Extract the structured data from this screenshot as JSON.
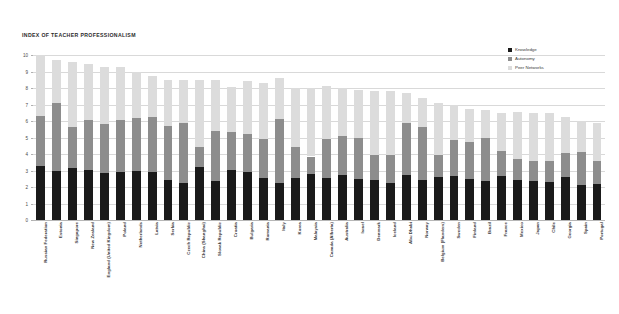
{
  "chart_data": {
    "type": "bar",
    "subtype": "stacked-vertical",
    "title": "INDEX OF TEACHER PROFESSIONALISM",
    "xlabel": "",
    "ylabel": "",
    "ylim": [
      0,
      10
    ],
    "ytick_labels": [
      "0",
      "1",
      "2",
      "3",
      "4",
      "5",
      "6",
      "7",
      "8",
      "9",
      "10"
    ],
    "ytick_values": [
      0,
      1,
      2,
      3,
      4,
      5,
      6,
      7,
      8,
      9,
      10
    ],
    "grid": true,
    "legend_position": "top-right",
    "categories": [
      "Russian Federation",
      "Estonia",
      "Singapore",
      "New Zealand",
      "England (United Kingdom)",
      "Poland",
      "Netherlands",
      "Latvia",
      "Serbia",
      "Czech Republic",
      "China (Shanghai)",
      "Slovak Republic",
      "Croatia",
      "Bulgaria",
      "Romania",
      "Italy",
      "Korea",
      "Malaysia",
      "Canada (Alberta)",
      "Australia",
      "Israel",
      "Denmark",
      "Iceland",
      "Abu Dhabi",
      "Norway",
      "Belgium (Flanders)",
      "Sweden",
      "Finland",
      "Brazil",
      "France",
      "Mexico",
      "Japan",
      "Chile",
      "Georgia",
      "Spain",
      "Portugal"
    ],
    "series": [
      {
        "name": "Knowledge",
        "color": "#1a1a1a",
        "values": [
          3.3,
          3.0,
          3.15,
          3.05,
          2.85,
          2.9,
          3.0,
          2.9,
          2.4,
          2.25,
          3.2,
          2.35,
          3.05,
          2.9,
          2.55,
          2.25,
          2.55,
          2.8,
          2.55,
          2.75,
          2.5,
          2.45,
          2.25,
          2.7,
          2.45,
          2.6,
          2.65,
          2.5,
          2.35,
          2.65,
          2.4,
          2.35,
          2.3,
          2.6,
          2.15,
          2.2
        ]
      },
      {
        "name": "Autonomy",
        "color": "#8d8d8d",
        "values": [
          3.0,
          4.1,
          2.5,
          3.0,
          2.95,
          3.15,
          3.2,
          3.35,
          3.3,
          3.65,
          1.2,
          3.05,
          2.3,
          2.3,
          2.35,
          3.85,
          1.9,
          1.05,
          2.35,
          2.35,
          2.5,
          1.5,
          1.7,
          3.2,
          3.2,
          1.35,
          2.2,
          2.25,
          2.6,
          1.55,
          1.3,
          1.25,
          1.25,
          1.45,
          1.95,
          1.4
        ]
      },
      {
        "name": "Peer Networks",
        "color": "#dcdcdc",
        "values": [
          3.7,
          2.6,
          3.9,
          3.4,
          3.5,
          3.25,
          2.8,
          2.5,
          2.8,
          2.6,
          4.1,
          3.1,
          2.7,
          3.2,
          3.4,
          2.5,
          3.55,
          4.15,
          3.2,
          2.9,
          2.85,
          3.85,
          3.85,
          1.8,
          1.75,
          3.15,
          2.15,
          1.95,
          1.7,
          2.3,
          2.85,
          2.9,
          2.95,
          2.2,
          1.9,
          2.25
        ]
      }
    ],
    "totals": [
      10.0,
      9.7,
      9.55,
      9.45,
      9.3,
      9.3,
      9.0,
      8.75,
      8.5,
      8.5,
      8.5,
      8.5,
      8.05,
      8.4,
      8.3,
      8.25,
      8.0,
      8.0,
      8.1,
      8.0,
      7.85,
      7.8,
      7.8,
      7.7,
      7.4,
      7.1,
      7.0,
      6.7,
      6.65,
      6.5,
      6.55,
      6.5,
      6.5,
      6.25,
      6.0,
      5.85
    ]
  },
  "legend": {
    "items": [
      {
        "label": "Knowledge",
        "color": "#1a1a1a"
      },
      {
        "label": "Autonomy",
        "color": "#8d8d8d"
      },
      {
        "label": "Peer Networks",
        "color": "#dcdcdc"
      }
    ]
  }
}
